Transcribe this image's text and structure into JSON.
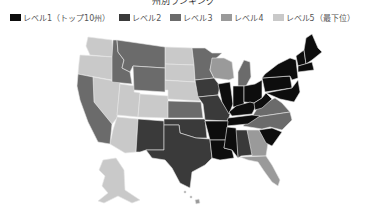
{
  "title": "州別ランキング",
  "legend": [
    {
      "label": "レベル1（トップ10州）",
      "color": "#0d0d0d"
    },
    {
      "label": "レベル2",
      "color": "#3a3a3a"
    },
    {
      "label": "レベル3",
      "color": "#6b6b6b"
    },
    {
      "label": "レベル4",
      "color": "#9a9a9a"
    },
    {
      "label": "レベル5（最下位）",
      "color": "#c9c9c9"
    }
  ],
  "map": {
    "region": "United States",
    "levels": {
      "level1": [
        "ME",
        "NH",
        "VT",
        "MA",
        "RI",
        "CT",
        "NY",
        "PA",
        "NJ",
        "DE",
        "MD",
        "OH",
        "IN",
        "IL",
        "KY",
        "WV",
        "TN",
        "AR",
        "LA",
        "MS",
        "SC"
      ],
      "level2": [
        "TX",
        "OK",
        "NM",
        "MO",
        "IA",
        "AL"
      ],
      "level3": [
        "CA",
        "ID",
        "MT",
        "WY",
        "MN",
        "KS",
        "MI",
        "VA",
        "NC"
      ],
      "level4": [
        "WI",
        "GA",
        "FL",
        "HI"
      ],
      "level5": [
        "WA",
        "OR",
        "NV",
        "UT",
        "CO",
        "AZ",
        "ND",
        "SD",
        "NE",
        "AK"
      ]
    }
  }
}
